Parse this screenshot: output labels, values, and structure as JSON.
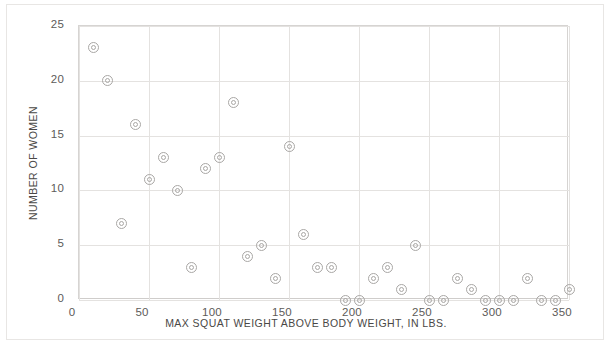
{
  "chart_data": {
    "type": "scatter",
    "title": "",
    "xlabel": "MAX SQUAT WEIGHT ABOVE BODY WEIGHT, IN LBS.",
    "ylabel": "NUMBER OF WOMEN",
    "xlim": [
      0,
      350
    ],
    "ylim": [
      0,
      25
    ],
    "xticks": [
      0,
      50,
      100,
      150,
      200,
      250,
      300,
      350
    ],
    "yticks": [
      0,
      5,
      10,
      15,
      20,
      25
    ],
    "grid": true,
    "legend": null,
    "marker": "double-circle",
    "marker_color": "#a9a7a5",
    "grid_color": "#e4e2e0",
    "axis_color": "#d6d4d2",
    "text_color": "#4a4846",
    "background": "#ffffff",
    "points": [
      {
        "x": 10,
        "y": 23
      },
      {
        "x": 20,
        "y": 20
      },
      {
        "x": 30,
        "y": 7
      },
      {
        "x": 40,
        "y": 16
      },
      {
        "x": 50,
        "y": 11
      },
      {
        "x": 60,
        "y": 13
      },
      {
        "x": 70,
        "y": 10
      },
      {
        "x": 80,
        "y": 3
      },
      {
        "x": 90,
        "y": 12
      },
      {
        "x": 100,
        "y": 13
      },
      {
        "x": 110,
        "y": 18
      },
      {
        "x": 120,
        "y": 4
      },
      {
        "x": 130,
        "y": 5
      },
      {
        "x": 140,
        "y": 2
      },
      {
        "x": 150,
        "y": 14
      },
      {
        "x": 160,
        "y": 6
      },
      {
        "x": 170,
        "y": 3
      },
      {
        "x": 180,
        "y": 3
      },
      {
        "x": 190,
        "y": 0
      },
      {
        "x": 200,
        "y": 0
      },
      {
        "x": 210,
        "y": 2
      },
      {
        "x": 220,
        "y": 3
      },
      {
        "x": 230,
        "y": 1
      },
      {
        "x": 240,
        "y": 5
      },
      {
        "x": 250,
        "y": 0
      },
      {
        "x": 260,
        "y": 0
      },
      {
        "x": 270,
        "y": 2
      },
      {
        "x": 280,
        "y": 1
      },
      {
        "x": 290,
        "y": 0
      },
      {
        "x": 300,
        "y": 0
      },
      {
        "x": 310,
        "y": 0
      },
      {
        "x": 320,
        "y": 2
      },
      {
        "x": 330,
        "y": 0
      },
      {
        "x": 340,
        "y": 0
      },
      {
        "x": 350,
        "y": 1
      }
    ]
  }
}
